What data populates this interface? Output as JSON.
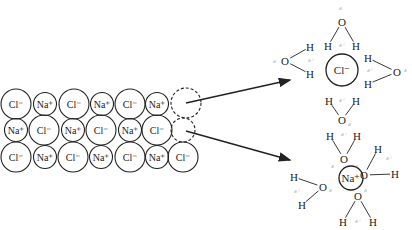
{
  "diagram": {
    "lattice": {
      "rows": [
        [
          {
            "label": "Cl⁻",
            "type": "Cl",
            "x": 16,
            "y": 104
          },
          {
            "label": "Na⁺",
            "type": "Na",
            "x": 45,
            "y": 104
          },
          {
            "label": "Cl⁻",
            "type": "Cl",
            "x": 74,
            "y": 104
          },
          {
            "label": "Na⁺",
            "type": "Na",
            "x": 102,
            "y": 104
          },
          {
            "label": "Cl⁻",
            "type": "Cl",
            "x": 130,
            "y": 104
          },
          {
            "label": "Na⁺",
            "type": "Na",
            "x": 157,
            "y": 104
          }
        ],
        [
          {
            "label": "Na⁺",
            "type": "Na",
            "x": 16,
            "y": 130
          },
          {
            "label": "Cl⁻",
            "type": "Cl",
            "x": 44,
            "y": 130
          },
          {
            "label": "Na⁺",
            "type": "Na",
            "x": 73,
            "y": 130
          },
          {
            "label": "Cl⁻",
            "type": "Cl",
            "x": 101,
            "y": 130
          },
          {
            "label": "Na⁺",
            "type": "Na",
            "x": 130,
            "y": 130
          },
          {
            "label": "Cl⁻",
            "type": "Cl",
            "x": 157,
            "y": 130
          }
        ],
        [
          {
            "label": "Cl⁻",
            "type": "Cl",
            "x": 16,
            "y": 157
          },
          {
            "label": "Na⁺",
            "type": "Na",
            "x": 45,
            "y": 157
          },
          {
            "label": "Cl⁻",
            "type": "Cl",
            "x": 73,
            "y": 157
          },
          {
            "label": "Na⁺",
            "type": "Na",
            "x": 101,
            "y": 157
          },
          {
            "label": "Cl⁻",
            "type": "Cl",
            "x": 130,
            "y": 157
          },
          {
            "label": "Na⁺",
            "type": "Na",
            "x": 157,
            "y": 157
          },
          {
            "label": "Cl⁻",
            "type": "Cl",
            "x": 183,
            "y": 157
          }
        ]
      ],
      "vacancies": [
        {
          "x": 186,
          "y": 103,
          "r": 15,
          "ion": "Cl"
        },
        {
          "x": 183,
          "y": 130,
          "r": 12,
          "ion": "Na"
        }
      ]
    },
    "arrows": [
      {
        "from": [
          186,
          103
        ],
        "to": [
          290,
          80
        ]
      },
      {
        "from": [
          186,
          131
        ],
        "to": [
          290,
          160
        ]
      }
    ],
    "hydrated_chloride": {
      "ion_label": "Cl⁻",
      "center": [
        342,
        70
      ],
      "radius": 16,
      "waters": [
        {
          "O": [
            342,
            22
          ],
          "H1": [
            328,
            46
          ],
          "H2": [
            356,
            46
          ],
          "d_minus": [
            342,
            8
          ],
          "d_plus": [
            342,
            45
          ]
        },
        {
          "O": [
            285,
            61
          ],
          "H1": [
            310,
            47
          ],
          "H2": [
            310,
            74
          ],
          "d_minus": [
            276,
            61
          ],
          "d_plus": [
            311,
            60
          ]
        },
        {
          "O": [
            397,
            72
          ],
          "H1": [
            368,
            58
          ],
          "H2": [
            368,
            84
          ],
          "d_minus": [
            407,
            70
          ],
          "d_plus": [
            370,
            70
          ]
        },
        {
          "O": [
            342,
            120
          ],
          "H1": [
            329,
            101
          ],
          "H2": [
            356,
            101
          ],
          "d_minus": [
            351,
            124
          ],
          "d_plus": [
            342,
            100
          ]
        }
      ],
      "atom_O": "O",
      "atom_H": "H",
      "delta_minus": "δ⁻",
      "delta_plus": "δ⁺"
    },
    "hydrated_sodium": {
      "ion_label": "Na⁺",
      "center": [
        351,
        178
      ],
      "radius": 12,
      "waters": [
        {
          "O": [
            344,
            159
          ],
          "H1": [
            330,
            136
          ],
          "H2": [
            357,
            136
          ],
          "d_minus": [
            334,
            166
          ],
          "d_plus": [
            344,
            134
          ]
        },
        {
          "O": [
            364,
            175
          ],
          "H1": [
            378,
            149
          ],
          "H2": [
            395,
            174
          ],
          "d_minus": [
            358,
            166
          ],
          "d_plus": [
            389,
            158
          ]
        },
        {
          "O": [
            323,
            187
          ],
          "H1": [
            294,
            177
          ],
          "H2": [
            302,
            205
          ],
          "d_minus": [
            332,
            190
          ],
          "d_plus": [
            297,
            191
          ]
        },
        {
          "O": [
            358,
            196
          ],
          "H1": [
            343,
            222
          ],
          "H2": [
            373,
            222
          ],
          "d_minus": [
            367,
            190
          ],
          "d_plus": [
            358,
            221
          ]
        }
      ],
      "atom_O": "O",
      "atom_H": "H",
      "delta_minus": "δ⁻",
      "delta_plus": "δ⁺"
    },
    "colors": {
      "stroke": "#222222",
      "delta": "#888888",
      "background": "#ffffff"
    }
  }
}
